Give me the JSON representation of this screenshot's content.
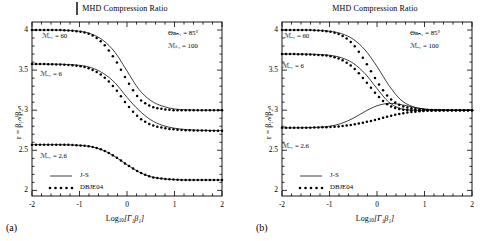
{
  "figure": {
    "panels": [
      {
        "tag": "(a)",
        "title": "MHD Compression Ratio",
        "xlabel_prefix": "Log",
        "xlabel_sub": "10",
        "xlabel_body": "[Γ₁β₁]",
        "ylabel": "r = β₁ₙ/β₂ₙ",
        "xticks": [
          "-2",
          "-1",
          "0",
          "1",
          "2"
        ],
        "yticks": [
          "2",
          "2.5",
          "3",
          "3.5",
          "4"
        ],
        "annotations": [
          {
            "name": "curve-label-ma-60",
            "text": "ℳₐ₁ = 60"
          },
          {
            "name": "curve-label-ma-6",
            "text": "ℳₐ₁ = 6"
          },
          {
            "name": "curve-label-ma-2p6",
            "text": "ℳₐ₁ = 2.6"
          }
        ],
        "params": [
          {
            "name": "param-theta-bn1",
            "text": "Θʙₙ₁ = 85°"
          },
          {
            "name": "param-ms1",
            "text": "ℳₛ₁ = 100"
          }
        ],
        "legend": [
          {
            "name": "legend-js",
            "label": "J-S",
            "style": "solid"
          },
          {
            "name": "legend-dbje04",
            "label": "DBJE04",
            "style": "dotted"
          }
        ]
      },
      {
        "tag": "(b)",
        "title": "MHD Compression Ratio",
        "xlabel_prefix": "Log",
        "xlabel_sub": "10",
        "xlabel_body": "[Γ₁β₁]",
        "ylabel": "r = β₁ₙ/β₂ₙ",
        "xticks": [
          "-2",
          "-1",
          "0",
          "1",
          "2"
        ],
        "yticks": [
          "2",
          "2.5",
          "3",
          "3.5",
          "4"
        ],
        "annotations": [
          {
            "name": "curve-label-ma-60",
            "text": "ℳₐ₁ = 60"
          },
          {
            "name": "curve-label-ma-6",
            "text": "ℳₐ₁ = 6"
          },
          {
            "name": "curve-label-ma-2p6",
            "text": "ℳₐ₁ = 2.6"
          }
        ],
        "params": [
          {
            "name": "param-theta-bn1",
            "text": "Θʙₙ₁ = 85°"
          },
          {
            "name": "param-ms1",
            "text": "ℳₐ₁ = 100"
          }
        ],
        "legend": [
          {
            "name": "legend-js",
            "label": "J-S",
            "style": "solid"
          },
          {
            "name": "legend-dbje04",
            "label": "DBJE04",
            "style": "dotted"
          }
        ]
      }
    ]
  },
  "chart_data": [
    {
      "type": "line",
      "panel": "(a)",
      "title": "MHD Compression Ratio",
      "xlabel": "Log10[Γ1β1]",
      "ylabel": "r = β1n/β2n",
      "xlim": [
        -2,
        2
      ],
      "ylim": [
        1.93,
        4.1
      ],
      "xticks": [
        -2,
        -1,
        0,
        1,
        2
      ],
      "yticks": [
        2,
        2.5,
        3,
        3.5,
        4
      ],
      "grid": false,
      "legend_position": "lower-left",
      "annotations": [
        "ℳa1 = 60",
        "ℳa1 = 6",
        "ℳa1 = 2.6",
        "ΘBn1 = 85°",
        "ℳs1 = 100"
      ],
      "x": [
        -2.0,
        -1.75,
        -1.5,
        -1.25,
        -1.0,
        -0.75,
        -0.5,
        -0.25,
        0.0,
        0.25,
        0.5,
        0.75,
        1.0,
        1.25,
        1.5,
        1.75,
        2.0
      ],
      "series": [
        {
          "name": "JS-Ma60",
          "style": "solid",
          "values": [
            4.0,
            4.0,
            4.0,
            3.995,
            3.985,
            3.95,
            3.87,
            3.72,
            3.49,
            3.26,
            3.12,
            3.05,
            3.015,
            3.005,
            3.0,
            3.0,
            3.0
          ]
        },
        {
          "name": "DBJE04-Ma60",
          "style": "dotted",
          "values": [
            4.0,
            4.0,
            4.0,
            3.995,
            3.98,
            3.94,
            3.83,
            3.63,
            3.37,
            3.15,
            3.05,
            3.015,
            3.0,
            3.0,
            3.0,
            3.0,
            3.0
          ]
        },
        {
          "name": "JS-Ma6",
          "style": "solid",
          "values": [
            3.575,
            3.575,
            3.575,
            3.57,
            3.56,
            3.53,
            3.46,
            3.34,
            3.16,
            3.0,
            2.88,
            2.81,
            2.775,
            2.758,
            2.75,
            2.747,
            2.745
          ]
        },
        {
          "name": "DBJE04-Ma6",
          "style": "dotted",
          "values": [
            3.575,
            3.575,
            3.57,
            3.565,
            3.55,
            3.51,
            3.42,
            3.27,
            3.07,
            2.91,
            2.82,
            2.78,
            2.76,
            2.75,
            2.747,
            2.745,
            2.745
          ]
        },
        {
          "name": "JS-Ma2.6",
          "style": "solid",
          "values": [
            2.57,
            2.57,
            2.57,
            2.568,
            2.562,
            2.545,
            2.5,
            2.42,
            2.32,
            2.23,
            2.17,
            2.145,
            2.134,
            2.13,
            2.13,
            2.13,
            2.13
          ]
        },
        {
          "name": "DBJE04-Ma2.6",
          "style": "dotted",
          "values": [
            2.57,
            2.57,
            2.57,
            2.568,
            2.562,
            2.545,
            2.5,
            2.42,
            2.32,
            2.23,
            2.17,
            2.145,
            2.134,
            2.13,
            2.13,
            2.13,
            2.13
          ]
        }
      ]
    },
    {
      "type": "line",
      "panel": "(b)",
      "title": "MHD Compression Ratio",
      "xlabel": "Log10[Γ1β1]",
      "ylabel": "r = β1n/β2n",
      "xlim": [
        -2,
        2
      ],
      "ylim": [
        1.93,
        4.1
      ],
      "xticks": [
        -2,
        -1,
        0,
        1,
        2
      ],
      "yticks": [
        2,
        2.5,
        3,
        3.5,
        4
      ],
      "grid": false,
      "legend_position": "lower-left",
      "annotations": [
        "ℳa1 = 60",
        "ℳa1 = 6",
        "ℳa1 = 2.6",
        "ΘBn1 = 85°",
        "ℳa1 = 100"
      ],
      "x": [
        -2.0,
        -1.75,
        -1.5,
        -1.25,
        -1.0,
        -0.75,
        -0.5,
        -0.25,
        0.0,
        0.25,
        0.5,
        0.75,
        1.0,
        1.25,
        1.5,
        1.75,
        2.0
      ],
      "series": [
        {
          "name": "JS-Ma60",
          "style": "solid",
          "values": [
            4.0,
            4.0,
            4.0,
            3.995,
            3.985,
            3.955,
            3.885,
            3.75,
            3.545,
            3.31,
            3.13,
            3.045,
            3.012,
            3.003,
            3.0,
            3.0,
            3.0
          ]
        },
        {
          "name": "DBJE04-Ma60",
          "style": "dotted",
          "values": [
            4.0,
            4.0,
            4.0,
            3.995,
            3.98,
            3.935,
            3.82,
            3.61,
            3.36,
            3.16,
            3.06,
            3.02,
            3.005,
            3.0,
            3.0,
            3.0,
            3.0
          ]
        },
        {
          "name": "JS-Ma6",
          "style": "solid",
          "values": [
            3.7,
            3.7,
            3.7,
            3.695,
            3.685,
            3.655,
            3.585,
            3.455,
            3.27,
            3.1,
            3.02,
            3.0,
            3.0,
            3.0,
            3.0,
            3.0,
            3.0
          ]
        },
        {
          "name": "DBJE04-Ma6",
          "style": "dotted",
          "values": [
            3.7,
            3.7,
            3.695,
            3.69,
            3.675,
            3.63,
            3.53,
            3.37,
            3.19,
            3.06,
            3.01,
            3.0,
            3.0,
            3.0,
            3.0,
            3.0,
            3.0
          ]
        },
        {
          "name": "JS-Ma2.6",
          "style": "solid",
          "values": [
            2.78,
            2.78,
            2.782,
            2.787,
            2.8,
            2.835,
            2.9,
            2.985,
            3.055,
            3.085,
            3.07,
            3.04,
            3.015,
            3.005,
            3.0,
            3.0,
            3.0
          ]
        },
        {
          "name": "DBJE04-Ma2.6",
          "style": "dotted",
          "values": [
            2.78,
            2.78,
            2.781,
            2.784,
            2.79,
            2.8,
            2.82,
            2.85,
            2.885,
            2.925,
            2.957,
            2.978,
            2.99,
            2.996,
            2.999,
            3.0,
            3.0
          ]
        }
      ]
    }
  ]
}
